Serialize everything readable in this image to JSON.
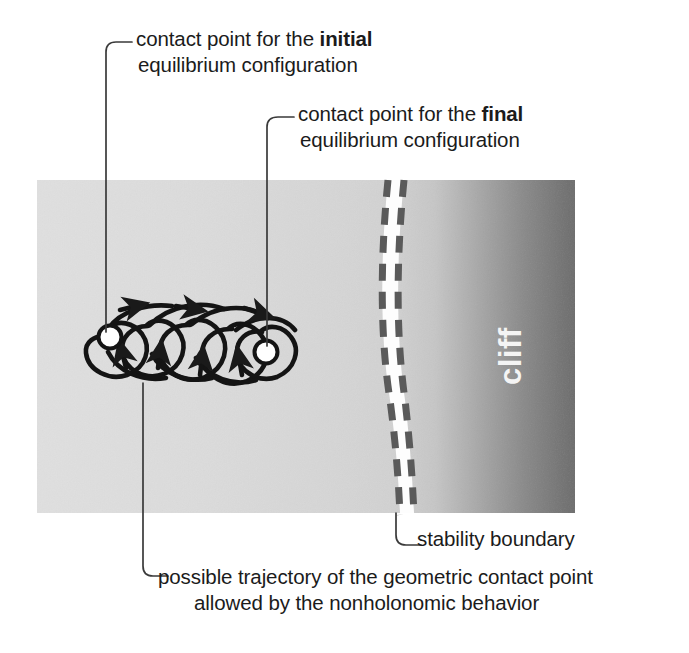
{
  "figure": {
    "panel": {
      "x": 37,
      "y": 180,
      "width": 538,
      "height": 333,
      "gradient": {
        "left_color": "#dedede",
        "mid_color": "#d4d4d4",
        "right_color": "#6f6f6f",
        "description": "flat light gray left portion darkening toward the right edge"
      },
      "cliff_label": "cliff",
      "cliff_label_color": "#f2f2f2",
      "cliff_label_rotation_deg": -90
    },
    "stability_boundary": {
      "label": "stability boundary",
      "dash_color": "#5c5c5c",
      "band_color": "#fdfdfd",
      "left_line_x_top": 380,
      "left_line_x_bottom": 392,
      "right_line_x_top": 400,
      "right_line_x_bottom": 406
    },
    "trajectory": {
      "stroke_color": "#1a1a1a",
      "loop_count": 5,
      "marker_color": "#ffffff",
      "marker_stroke": "#1a1a1a",
      "initial_contact_point": {
        "x": 110,
        "y": 337
      },
      "final_contact_point": {
        "x": 266,
        "y": 352
      }
    },
    "callouts": [
      {
        "name": "initial-equilibrium",
        "line1_prefix": "contact point for the ",
        "line1_bold": "initial",
        "line2": "equilibrium configuration",
        "leader_x": 106,
        "leader_from_y": 44,
        "leader_to_y": 332
      },
      {
        "name": "final-equilibrium",
        "line1_prefix": "contact point for the ",
        "line1_bold": "final",
        "line2": "equilibrium configuration",
        "leader_x": 267,
        "leader_from_y": 119,
        "leader_to_y": 346
      },
      {
        "name": "stability-boundary",
        "line1_prefix": "stability boundary",
        "line1_bold": "",
        "line2": "",
        "leader_x": 396,
        "leader_from_y": 513,
        "leader_to_y": 545
      },
      {
        "name": "possible-trajectory",
        "line1_prefix": "possible trajectory of the geometric contact point",
        "line1_bold": "",
        "line2": "allowed by the nonholonomic behavior",
        "leader_x": 143,
        "leader_from_y": 383,
        "leader_to_y": 578
      }
    ]
  }
}
